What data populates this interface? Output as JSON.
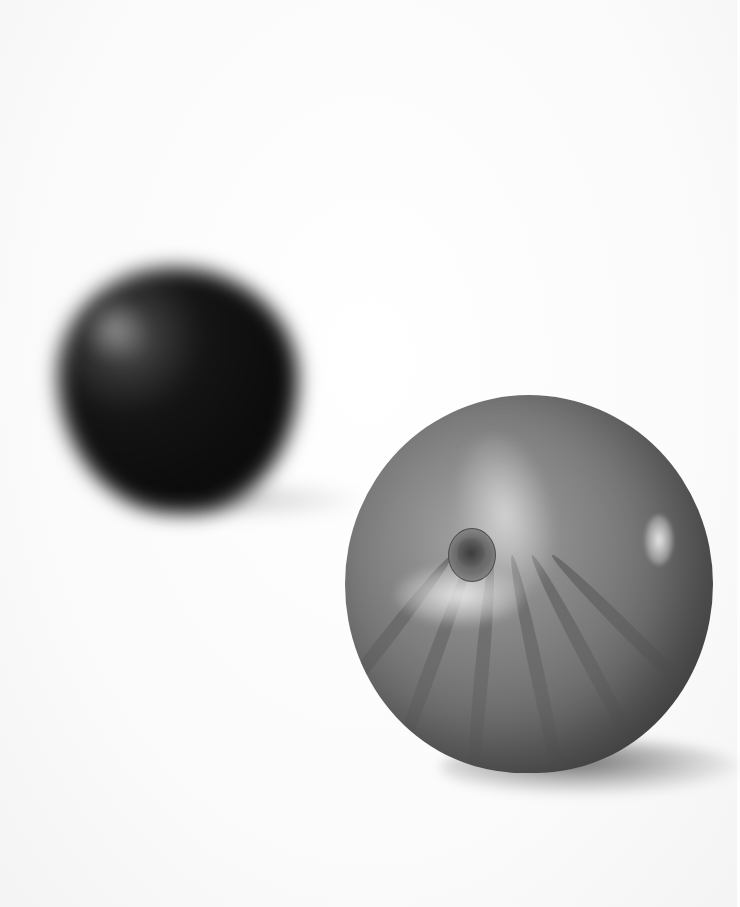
{
  "image": {
    "description": "Black-and-white photograph of two fruits on a white background",
    "subjects": [
      {
        "name": "dark-apple",
        "position": "background-left",
        "focus": "blurred"
      },
      {
        "name": "striped-apple",
        "position": "foreground-right",
        "focus": "sharp"
      }
    ],
    "colors": {
      "background": "#fdfdfd",
      "dark_fruit": "#0b0b0b",
      "front_fruit": "#8a8a8a"
    }
  }
}
